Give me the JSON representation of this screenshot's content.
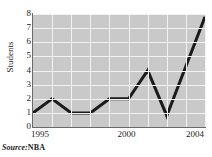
{
  "figure": {
    "title": "",
    "source_label": "Source:",
    "source_value": "NBA",
    "colors": {
      "plot_background": "#c9c9c9",
      "gridline": "#f2f2f2",
      "line": "#1a1a1a",
      "axis": "#6a6a6a",
      "text": "#1d1d1d",
      "page_background": "#ffffff"
    }
  },
  "chart_data": {
    "type": "line",
    "title": "",
    "xlabel": "",
    "ylabel": "Students",
    "x": [
      1995,
      1996,
      1997,
      1998,
      1999,
      2000,
      2001,
      2002,
      2004
    ],
    "values": [
      1,
      2,
      1,
      1,
      2,
      2,
      4,
      0.8,
      7.8
    ],
    "series": [
      {
        "name": "Students",
        "values": [
          1,
          2,
          1,
          1,
          2,
          2,
          4,
          0.8,
          7.8
        ]
      }
    ],
    "xlim": [
      1995,
      2004
    ],
    "ylim": [
      0,
      8
    ],
    "ytick_labels": [
      "0",
      "1",
      "2",
      "3",
      "4",
      "5",
      "6",
      "7",
      "8"
    ],
    "ytick_values": [
      0,
      1,
      2,
      3,
      4,
      5,
      6,
      7,
      8
    ],
    "xtick_labels": [
      "1995",
      "2000",
      "2004"
    ],
    "xtick_values": [
      1995,
      2000,
      2004
    ],
    "grid": true,
    "legend": "none",
    "line_width": 3,
    "markers": false
  }
}
